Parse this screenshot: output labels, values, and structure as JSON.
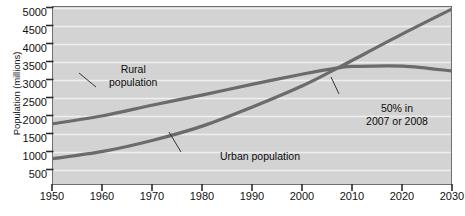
{
  "chart_data": {
    "type": "line",
    "title": "",
    "xlabel": "",
    "ylabel": "Population (millions)",
    "xlim": [
      1950,
      2030
    ],
    "ylim": [
      250,
      5000
    ],
    "xticks": [
      1950,
      1960,
      1970,
      1980,
      1990,
      2000,
      2010,
      2020,
      2030
    ],
    "yticks": [
      500,
      1000,
      1500,
      2000,
      2500,
      3000,
      3500,
      4000,
      4500,
      5000
    ],
    "grid": true,
    "grid_axis": "y",
    "legend": "inline-labels",
    "series": [
      {
        "name": "Rural population",
        "color": "#6b6b6b",
        "x": [
          1950,
          1960,
          1970,
          1980,
          1990,
          2000,
          2007,
          2010,
          2020,
          2030
        ],
        "values": [
          1800,
          2020,
          2320,
          2600,
          2900,
          3180,
          3350,
          3390,
          3400,
          3260
        ]
      },
      {
        "name": "Urban population",
        "color": "#6b6b6b",
        "x": [
          1950,
          1960,
          1970,
          1980,
          1990,
          2000,
          2007,
          2010,
          2020,
          2030
        ],
        "values": [
          830,
          1030,
          1340,
          1740,
          2270,
          2860,
          3350,
          3570,
          4300,
          5000
        ]
      }
    ],
    "annotations": [
      {
        "id": "rural",
        "text_lines": [
          "Rural",
          "population"
        ],
        "points_to_year": 1966,
        "points_to_value": 2180
      },
      {
        "id": "urban",
        "text_lines": [
          "Urban population"
        ],
        "points_to_year": 1978,
        "points_to_value": 1690
      },
      {
        "id": "crossing",
        "text_lines": [
          "50% in",
          "2007 or 2008"
        ],
        "points_to_year": 2007,
        "points_to_value": 3350
      }
    ]
  },
  "labels": {
    "ylabel": "Population (millions)",
    "ytick_0": "500",
    "ytick_1": "1000",
    "ytick_2": "1500",
    "ytick_3": "2000",
    "ytick_4": "2500",
    "ytick_5": "3000",
    "ytick_6": "3500",
    "ytick_7": "4000",
    "ytick_8": "4500",
    "ytick_9": "5000",
    "xtick_0": "1950",
    "xtick_1": "1960",
    "xtick_2": "1970",
    "xtick_3": "1980",
    "xtick_4": "1990",
    "xtick_5": "2000",
    "xtick_6": "2010",
    "xtick_7": "2020",
    "xtick_8": "2030",
    "anno_rural_line1": "Rural",
    "anno_rural_line2": "population",
    "anno_urban_line1": "Urban population",
    "anno_cross_line1": "50% in",
    "anno_cross_line2": "2007 or 2008"
  },
  "colors": {
    "plot_background": "#d3d3d3",
    "frame": "#6f6f6f",
    "gridline": "#efefef",
    "curve": "#6b6b6b",
    "text": "#111111"
  }
}
